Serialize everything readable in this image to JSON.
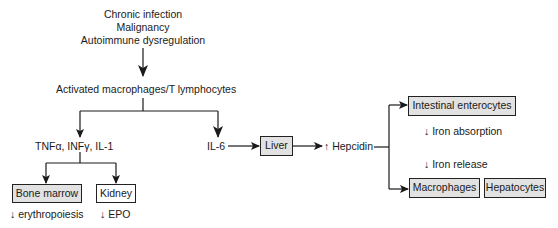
{
  "causes": [
    "Chronic infection",
    "Malignancy",
    "Autoimmune dysregulation"
  ],
  "activated_cells": "Activated macrophages/T lymphocytes",
  "cytokines_left": "TNFα, INFγ, IL-1",
  "cytokine_right": "IL-6",
  "nodes": {
    "bone_marrow": "Bone marrow",
    "kidney": "Kidney",
    "liver": "Liver",
    "intestinal": "Intestinal enterocytes",
    "macrophages": "Macrophages",
    "hepatocytes": "Hepatocytes"
  },
  "effects": {
    "bone_marrow": "↓ erythropoiesis",
    "kidney": "↓ EPO",
    "hepcidin": "↑ Hepcidin",
    "iron_absorption": "↓ Iron absorption",
    "iron_release": "↓ Iron release"
  },
  "colors": {
    "box_fill": "#e2e2e2",
    "line": "#1a1a1a"
  }
}
